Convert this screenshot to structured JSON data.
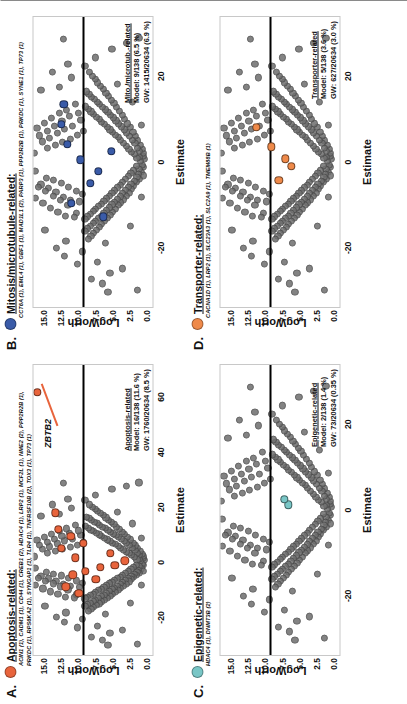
{
  "figure": {
    "orientation": "rotated-90",
    "axis": {
      "x_label": "Estimate",
      "y_label": "LogWorth",
      "y_ticks": [
        "15.0",
        "12.5",
        "10.0",
        "7.5",
        "5.0",
        "2.5",
        "0.0"
      ],
      "y_values": [
        15.0,
        12.5,
        10.0,
        7.5,
        5.0,
        2.5,
        0.0
      ],
      "y_lim": [
        -1.0,
        16.6
      ],
      "background_point_color": "#6e6e6e"
    }
  },
  "panels": [
    {
      "letter": "A.",
      "legend_title": "Apoptosis-related:",
      "dot_color": "#e8643c",
      "genes": "ACIN1 (1), CADM1 (1), CD44 (1), CREB1 (2), HDAC4 (1), LRP2 (1), MCF2L (1), NME2 (2), PPP2R2B (1), PRKDC (1), RPS6KA2 (1), SYNGAP1 (1), TLR4 (1), TNFRSF10B (2), TOX3 (1), TP73 (1)",
      "annot_title": "Apoptosis-related",
      "annot_model": "Model: 16/138 (11.6 %)",
      "annot_gw": "GW: 1760/20634 (8.5 %)",
      "x_ticks": [
        "-20",
        "0",
        "20",
        "40",
        "60"
      ],
      "x_values": [
        -20,
        0,
        20,
        40,
        60
      ],
      "x_lim": [
        -34,
        72
      ],
      "callout": {
        "text": "ZBTB2",
        "x": 47,
        "y": 14.6,
        "point_x": 62,
        "point_y": 16.0
      }
    },
    {
      "letter": "B.",
      "legend_title": "Mitosis/microtubule-related:",
      "dot_color": "#3a5ba8",
      "genes": "CCT6A (1), EML4 (1), GBF1 (1), MAD1L1 (2), PARP3 (1), PPP2R2B (1), PRKDC (1), SYNE1 (1), TP73 (1)",
      "annot_title": "Mito./microtub.-related",
      "annot_model": "Model: 9/138 (6.5 %)",
      "annot_gw": "GW: 1415/20634 (6.9 %)",
      "x_ticks": [
        "-20",
        "0",
        "20"
      ],
      "x_values": [
        -20,
        0,
        20
      ],
      "x_lim": [
        -34,
        34
      ],
      "callout": null
    },
    {
      "letter": "C.",
      "legend_title": "Epigenetic-related:",
      "dot_color": "#79c6c6",
      "genes": "HDAC4 (1), DNMT3B (2)",
      "annot_title": "Epigenetic-related",
      "annot_model": "Model: 2/138 (1.4 %)",
      "annot_gw": "GW: 73/20634 (0.35 %)",
      "x_ticks": [
        "-20",
        "0",
        "20"
      ],
      "x_values": [
        -20,
        0,
        20
      ],
      "x_lim": [
        -34,
        34
      ],
      "callout": null
    },
    {
      "letter": "D.",
      "legend_title": "Transporter-related:",
      "dot_color": "#ef8a4a",
      "genes": "CACNA1D (1), LRP2 (1), SLC23A3 (1), SLC2A9 (1), TMEM88B (1)",
      "annot_title": "Transporter-related",
      "annot_model": "Model: 5/138 (3.6 %)",
      "annot_gw": "GW: 627/20634 (3.0 %)",
      "x_ticks": [
        "-20",
        "0",
        "20"
      ],
      "x_values": [
        -20,
        0,
        20
      ],
      "x_lim": [
        -34,
        34
      ],
      "callout": null
    }
  ],
  "chart_data": {
    "type": "scatter",
    "title": "",
    "xlabel": "Estimate",
    "ylabel": "LogWorth",
    "grid": false,
    "legend_position": "top-left-per-panel",
    "shared_background_points": [
      [
        -1.2,
        0.3
      ],
      [
        0.6,
        0.2
      ],
      [
        1.4,
        0.4
      ],
      [
        -0.7,
        0.5
      ],
      [
        2.1,
        0.3
      ],
      [
        -2.4,
        0.6
      ],
      [
        3.0,
        0.5
      ],
      [
        -3.2,
        0.4
      ],
      [
        0.2,
        0.8
      ],
      [
        1.1,
        0.9
      ],
      [
        -1.6,
        1.0
      ],
      [
        2.6,
        0.9
      ],
      [
        -2.9,
        1.1
      ],
      [
        4.0,
        0.8
      ],
      [
        -4.1,
        0.9
      ],
      [
        0.9,
        1.3
      ],
      [
        -1.0,
        1.4
      ],
      [
        3.3,
        1.2
      ],
      [
        -3.6,
        1.3
      ],
      [
        5.0,
        1.2
      ],
      [
        -4.8,
        1.4
      ],
      [
        1.8,
        1.7
      ],
      [
        -2.0,
        1.8
      ],
      [
        4.4,
        1.6
      ],
      [
        -4.5,
        1.7
      ],
      [
        6.0,
        1.5
      ],
      [
        -5.6,
        1.8
      ],
      [
        2.4,
        2.1
      ],
      [
        -2.6,
        2.2
      ],
      [
        5.2,
        2.0
      ],
      [
        -5.1,
        2.2
      ],
      [
        7.0,
        1.9
      ],
      [
        -6.4,
        2.1
      ],
      [
        3.1,
        2.5
      ],
      [
        -3.4,
        2.6
      ],
      [
        6.1,
        2.4
      ],
      [
        -5.9,
        2.6
      ],
      [
        8.2,
        2.3
      ],
      [
        -7.2,
        2.5
      ],
      [
        3.8,
        2.9
      ],
      [
        -4.0,
        3.0
      ],
      [
        6.9,
        2.8
      ],
      [
        -6.6,
        3.0
      ],
      [
        9.0,
        2.7
      ],
      [
        -8.0,
        2.9
      ],
      [
        4.5,
        3.3
      ],
      [
        -4.7,
        3.4
      ],
      [
        7.6,
        3.2
      ],
      [
        -7.3,
        3.4
      ],
      [
        10.1,
        3.1
      ],
      [
        -8.8,
        3.3
      ],
      [
        5.1,
        3.7
      ],
      [
        -5.4,
        3.8
      ],
      [
        8.3,
        3.6
      ],
      [
        -8.1,
        3.8
      ],
      [
        11.0,
        3.5
      ],
      [
        -9.5,
        3.7
      ],
      [
        5.8,
        4.1
      ],
      [
        -6.0,
        4.2
      ],
      [
        9.0,
        4.0
      ],
      [
        -8.7,
        4.2
      ],
      [
        12.0,
        3.9
      ],
      [
        -10.2,
        4.1
      ],
      [
        6.4,
        4.5
      ],
      [
        -6.7,
        4.6
      ],
      [
        9.7,
        4.4
      ],
      [
        -9.4,
        4.6
      ],
      [
        12.9,
        4.3
      ],
      [
        -11.0,
        4.5
      ],
      [
        7.0,
        4.9
      ],
      [
        -7.3,
        5.0
      ],
      [
        10.4,
        4.8
      ],
      [
        -10.0,
        5.0
      ],
      [
        13.8,
        4.7
      ],
      [
        -11.7,
        4.9
      ],
      [
        7.6,
        5.3
      ],
      [
        -7.9,
        5.4
      ],
      [
        11.0,
        5.2
      ],
      [
        -10.7,
        5.4
      ],
      [
        14.6,
        5.1
      ],
      [
        -12.4,
        5.3
      ],
      [
        8.2,
        5.7
      ],
      [
        -8.6,
        5.8
      ],
      [
        11.7,
        5.6
      ],
      [
        -11.3,
        5.8
      ],
      [
        15.4,
        5.5
      ],
      [
        -13.1,
        5.7
      ],
      [
        8.8,
        6.1
      ],
      [
        -9.2,
        6.2
      ],
      [
        12.3,
        6.0
      ],
      [
        -12.0,
        6.2
      ],
      [
        16.2,
        5.9
      ],
      [
        -13.8,
        6.1
      ],
      [
        9.4,
        6.5
      ],
      [
        -9.8,
        6.6
      ],
      [
        12.9,
        6.4
      ],
      [
        -12.6,
        6.6
      ],
      [
        17.0,
        6.3
      ],
      [
        -14.5,
        6.5
      ],
      [
        10.0,
        6.9
      ],
      [
        -10.4,
        7.0
      ],
      [
        13.5,
        6.8
      ],
      [
        -13.2,
        7.0
      ],
      [
        17.8,
        6.7
      ],
      [
        -15.2,
        6.9
      ],
      [
        10.6,
        7.3
      ],
      [
        -11.0,
        7.4
      ],
      [
        14.1,
        7.2
      ],
      [
        -13.8,
        7.4
      ],
      [
        18.6,
        7.1
      ],
      [
        -15.9,
        7.3
      ],
      [
        11.2,
        7.7
      ],
      [
        -11.6,
        7.8
      ],
      [
        14.7,
        7.6
      ],
      [
        -14.4,
        7.8
      ],
      [
        19.4,
        7.5
      ],
      [
        -16.6,
        7.7
      ],
      [
        11.8,
        8.1
      ],
      [
        -12.2,
        8.2
      ],
      [
        15.3,
        8.0
      ],
      [
        -15.0,
        8.2
      ],
      [
        20.2,
        7.9
      ],
      [
        -17.3,
        8.1
      ],
      [
        12.4,
        8.5
      ],
      [
        -12.8,
        8.6
      ],
      [
        15.9,
        8.4
      ],
      [
        -15.6,
        8.6
      ],
      [
        21.0,
        8.3
      ],
      [
        -18.0,
        8.5
      ],
      [
        13.0,
        8.9
      ],
      [
        -13.4,
        9.0
      ],
      [
        16.5,
        8.8
      ],
      [
        -16.2,
        9.0
      ],
      [
        7.2,
        9.2
      ],
      [
        -7.6,
        9.4
      ],
      [
        9.9,
        9.6
      ],
      [
        -9.3,
        9.8
      ],
      [
        11.5,
        10.0
      ],
      [
        -11.9,
        10.2
      ],
      [
        13.6,
        10.4
      ],
      [
        -13.0,
        10.6
      ],
      [
        6.3,
        10.1
      ],
      [
        -6.8,
        10.3
      ],
      [
        8.5,
        10.9
      ],
      [
        -8.9,
        11.1
      ],
      [
        10.7,
        11.3
      ],
      [
        -10.1,
        11.5
      ],
      [
        12.2,
        11.7
      ],
      [
        -12.7,
        11.9
      ],
      [
        5.4,
        11.2
      ],
      [
        -5.9,
        11.4
      ],
      [
        7.8,
        12.0
      ],
      [
        -8.2,
        12.2
      ],
      [
        9.6,
        12.4
      ],
      [
        -9.0,
        12.6
      ],
      [
        11.4,
        12.8
      ],
      [
        -11.8,
        13.0
      ],
      [
        4.6,
        12.3
      ],
      [
        -5.0,
        12.5
      ],
      [
        6.7,
        13.1
      ],
      [
        -7.1,
        13.3
      ],
      [
        8.4,
        13.5
      ],
      [
        -7.9,
        13.7
      ],
      [
        10.3,
        13.9
      ],
      [
        -10.8,
        14.1
      ],
      [
        3.9,
        13.4
      ],
      [
        -4.3,
        13.6
      ],
      [
        5.6,
        14.2
      ],
      [
        -6.1,
        14.4
      ],
      [
        7.3,
        14.6
      ],
      [
        -6.9,
        14.8
      ],
      [
        9.2,
        15.0
      ],
      [
        -9.7,
        15.2
      ],
      [
        3.2,
        14.5
      ],
      [
        -3.7,
        14.7
      ],
      [
        4.8,
        15.3
      ],
      [
        -5.3,
        15.5
      ],
      [
        6.2,
        15.7
      ],
      [
        -5.8,
        15.9
      ],
      [
        8.0,
        16.1
      ],
      [
        -8.5,
        16.3
      ],
      [
        -21.0,
        9.4
      ],
      [
        -23.5,
        7.1
      ],
      [
        -26.0,
        5.3
      ],
      [
        -18.5,
        11.8
      ],
      [
        -20.2,
        13.2
      ],
      [
        -24.0,
        10.1
      ],
      [
        -27.5,
        8.0
      ],
      [
        -16.0,
        14.9
      ],
      [
        -22.0,
        12.0
      ],
      [
        -19.0,
        6.0
      ],
      [
        -25.0,
        3.4
      ],
      [
        -28.5,
        6.4
      ],
      [
        19.8,
        11.0
      ],
      [
        22.5,
        9.0
      ],
      [
        17.6,
        12.8
      ],
      [
        21.0,
        13.8
      ],
      [
        24.5,
        7.5
      ],
      [
        26.5,
        5.0
      ],
      [
        16.8,
        15.5
      ],
      [
        23.0,
        11.5
      ],
      [
        18.2,
        4.2
      ],
      [
        27.8,
        2.8
      ],
      [
        -15.0,
        2.3
      ],
      [
        14.0,
        2.0
      ],
      [
        -30.0,
        1.2
      ],
      [
        29.0,
        1.0
      ],
      [
        -2.2,
        16.4
      ],
      [
        2.0,
        16.5
      ],
      [
        -30.5,
        5.6
      ],
      [
        28.8,
        12.2
      ],
      [
        -8.3,
        0.6
      ],
      [
        8.6,
        0.7
      ]
    ],
    "panel_highlight_points": {
      "A": [
        [
          -9.0,
          11.8
        ],
        [
          -3.4,
          8.9
        ],
        [
          1.5,
          10.4
        ],
        [
          5.0,
          12.5
        ],
        [
          18.0,
          13.4
        ],
        [
          -2.0,
          6.7
        ],
        [
          9.5,
          11.1
        ],
        [
          -6.2,
          7.4
        ],
        [
          3.2,
          5.2
        ],
        [
          -1.1,
          4.6
        ],
        [
          12.0,
          12.9
        ],
        [
          -11.5,
          9.9
        ],
        [
          6.8,
          9.2
        ],
        [
          0.4,
          3.1
        ],
        [
          -4.6,
          10.8
        ],
        [
          62.0,
          16.0
        ]
      ],
      "B": [
        [
          -9.6,
          11.0
        ],
        [
          -5.0,
          8.2
        ],
        [
          0.5,
          9.7
        ],
        [
          4.2,
          11.6
        ],
        [
          8.8,
          12.5
        ],
        [
          -12.8,
          6.3
        ],
        [
          2.6,
          5.1
        ],
        [
          -2.2,
          7.0
        ],
        [
          13.5,
          12.1
        ]
      ],
      "C": [
        [
          1.2,
          6.6
        ],
        [
          2.5,
          7.2
        ]
      ],
      "D": [
        [
          -4.2,
          8.0
        ],
        [
          0.8,
          7.0
        ],
        [
          3.6,
          9.1
        ],
        [
          8.2,
          11.3
        ],
        [
          -1.0,
          6.1
        ]
      ]
    }
  }
}
